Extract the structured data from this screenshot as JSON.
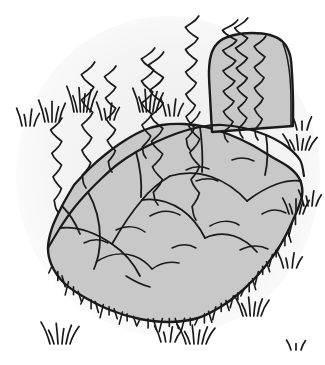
{
  "artwork": {
    "title": "Rock Outcrop with Grass",
    "subject": "boulder",
    "style": "pen-and-ink line drawing",
    "canvas": {
      "width": 325,
      "height": 365
    }
  },
  "palette": {
    "background": "#ffffff",
    "background_wash": "#f2f2f2",
    "rock_fill": "#c8c8c8",
    "pillar_fill": "#c8c8c8",
    "ink": "#1a1a1a",
    "ink_light": "#333333"
  },
  "elements": {
    "background_wash_label": "soft gray vignette wash",
    "rock_body_label": "large gray boulder mass",
    "rock_pillar_label": "upright rock pillar on ridge",
    "ridge_line_label": "top ridge outline",
    "cracks_label": "surface crack lines",
    "tendrils_label": "wavy rising tendrils",
    "grass_edge_label": "grass hatching along rock edge",
    "grass_tufts_label": "scattered grass tufts"
  },
  "chart_data": {
    "type": "scatter",
    "title": "Rock Outcrop with Grass",
    "xlabel": "",
    "ylabel": "",
    "xlim": [
      0,
      325
    ],
    "ylim": [
      0,
      365
    ],
    "grid": false,
    "legend": "none",
    "rock_outline": [
      [
        74,
        185
      ],
      [
        62,
        206
      ],
      [
        52,
        228
      ],
      [
        48,
        248
      ],
      [
        52,
        266
      ],
      [
        64,
        283
      ],
      [
        84,
        297
      ],
      [
        110,
        310
      ],
      [
        140,
        319
      ],
      [
        170,
        322
      ],
      [
        198,
        318
      ],
      [
        222,
        306
      ],
      [
        244,
        289
      ],
      [
        264,
        268
      ],
      [
        281,
        244
      ],
      [
        294,
        218
      ],
      [
        302,
        196
      ],
      [
        300,
        180
      ],
      [
        290,
        168
      ],
      [
        272,
        157
      ],
      [
        250,
        144
      ],
      [
        228,
        134
      ],
      [
        206,
        127
      ],
      [
        184,
        124
      ],
      [
        162,
        125
      ],
      [
        142,
        131
      ],
      [
        124,
        141
      ],
      [
        106,
        154
      ],
      [
        90,
        168
      ],
      [
        74,
        185
      ]
    ],
    "ridge_line": [
      [
        48,
        248
      ],
      [
        60,
        228
      ],
      [
        74,
        208
      ],
      [
        88,
        192
      ],
      [
        102,
        178
      ],
      [
        118,
        164
      ],
      [
        136,
        152
      ],
      [
        156,
        142
      ],
      [
        178,
        133
      ],
      [
        200,
        127
      ],
      [
        222,
        125
      ],
      [
        244,
        128
      ],
      [
        266,
        135
      ],
      [
        286,
        146
      ],
      [
        300,
        160
      ],
      [
        304,
        176
      ]
    ],
    "pillar_outline": [
      [
        212,
        132
      ],
      [
        210,
        96
      ],
      [
        209,
        70
      ],
      [
        212,
        52
      ],
      [
        220,
        41
      ],
      [
        234,
        35
      ],
      [
        252,
        33
      ],
      [
        270,
        35
      ],
      [
        283,
        42
      ],
      [
        290,
        55
      ],
      [
        292,
        74
      ],
      [
        293,
        100
      ],
      [
        293,
        126
      ]
    ],
    "tendrils": [
      {
        "base_x": 58,
        "base_y": 212,
        "top_y": 118,
        "amplitude": 7,
        "waves": 4
      },
      {
        "base_x": 86,
        "base_y": 188,
        "top_y": 62,
        "amplitude": 8,
        "waves": 5
      },
      {
        "base_x": 112,
        "base_y": 172,
        "top_y": 66,
        "amplitude": 7,
        "waves": 5
      },
      {
        "base_x": 146,
        "base_y": 158,
        "top_y": 48,
        "amplitude": 8,
        "waves": 5
      },
      {
        "base_x": 158,
        "base_y": 205,
        "top_y": 52,
        "amplitude": 9,
        "waves": 6
      },
      {
        "base_x": 190,
        "base_y": 150,
        "top_y": 16,
        "amplitude": 8,
        "waves": 6
      },
      {
        "base_x": 196,
        "base_y": 220,
        "top_y": 112,
        "amplitude": 7,
        "waves": 4
      },
      {
        "base_x": 228,
        "base_y": 142,
        "top_y": 20,
        "amplitude": 9,
        "waves": 6
      },
      {
        "base_x": 243,
        "base_y": 138,
        "top_y": 18,
        "amplitude": 8,
        "waves": 6
      },
      {
        "base_x": 258,
        "base_y": 140,
        "top_y": 36,
        "amplitude": 7,
        "waves": 5
      }
    ],
    "grass_tufts": [
      {
        "x": 28,
        "y": 126,
        "blades": 4,
        "height": 18,
        "spread": 12
      },
      {
        "x": 52,
        "y": 122,
        "blades": 5,
        "height": 22,
        "spread": 14
      },
      {
        "x": 82,
        "y": 112,
        "blades": 6,
        "height": 26,
        "spread": 16
      },
      {
        "x": 108,
        "y": 120,
        "blades": 4,
        "height": 18,
        "spread": 12
      },
      {
        "x": 148,
        "y": 112,
        "blades": 6,
        "height": 24,
        "spread": 16
      },
      {
        "x": 172,
        "y": 116,
        "blades": 4,
        "height": 18,
        "spread": 12
      },
      {
        "x": 302,
        "y": 130,
        "blades": 3,
        "height": 14,
        "spread": 10
      },
      {
        "x": 300,
        "y": 150,
        "blades": 6,
        "height": 16,
        "spread": 18
      },
      {
        "x": 296,
        "y": 214,
        "blades": 5,
        "height": 16,
        "spread": 14
      },
      {
        "x": 310,
        "y": 206,
        "blades": 4,
        "height": 16,
        "spread": 12
      },
      {
        "x": 290,
        "y": 268,
        "blades": 4,
        "height": 16,
        "spread": 13
      },
      {
        "x": 252,
        "y": 316,
        "blades": 6,
        "height": 20,
        "spread": 18
      },
      {
        "x": 196,
        "y": 344,
        "blades": 6,
        "height": 20,
        "spread": 20
      },
      {
        "x": 168,
        "y": 342,
        "blades": 4,
        "height": 16,
        "spread": 14
      },
      {
        "x": 60,
        "y": 344,
        "blades": 6,
        "height": 22,
        "spread": 20
      },
      {
        "x": 296,
        "y": 350,
        "blades": 3,
        "height": 10,
        "spread": 10
      }
    ]
  }
}
